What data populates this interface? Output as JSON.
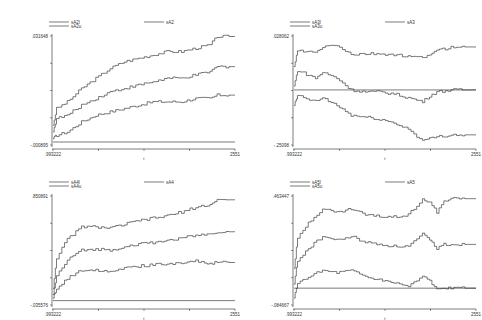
{
  "chart_data": [
    {
      "type": "line",
      "title": "",
      "xlabel": "t",
      "ylabel": "",
      "x_ticks": [
        ".993222",
        "2551"
      ],
      "y_ticks": [
        ".031648",
        "-.000895"
      ],
      "xlim": [
        0.993222,
        2551
      ],
      "ylim": [
        -0.000895,
        0.031648
      ],
      "legend": [
        "sA2l",
        "sA2u",
        "sA2"
      ],
      "legend_position": "top",
      "grid": false,
      "series": [
        {
          "name": "sA2u",
          "x": [
            1,
            50,
            200,
            400,
            600,
            800,
            1000,
            1200,
            1400,
            1600,
            1800,
            2000,
            2200,
            2300,
            2551
          ],
          "values": [
            0.005,
            0.01,
            0.012,
            0.016,
            0.019,
            0.022,
            0.024,
            0.025,
            0.026,
            0.027,
            0.027,
            0.028,
            0.029,
            0.0315,
            0.0315
          ]
        },
        {
          "name": "sA2",
          "x": [
            1,
            50,
            200,
            400,
            600,
            800,
            1000,
            1200,
            1400,
            1600,
            1800,
            2000,
            2200,
            2300,
            2551
          ],
          "values": [
            0.003,
            0.007,
            0.008,
            0.011,
            0.013,
            0.015,
            0.016,
            0.017,
            0.018,
            0.019,
            0.019,
            0.02,
            0.021,
            0.0225,
            0.0225
          ]
        },
        {
          "name": "sA2l",
          "x": [
            1,
            50,
            200,
            400,
            600,
            800,
            1000,
            1200,
            1400,
            1600,
            1800,
            2000,
            2200,
            2300,
            2551
          ],
          "values": [
            0.001,
            0.002,
            0.003,
            0.006,
            0.008,
            0.009,
            0.01,
            0.011,
            0.012,
            0.012,
            0.012,
            0.013,
            0.013,
            0.014,
            0.014
          ]
        },
        {
          "name": "zero",
          "x": [
            1,
            2551
          ],
          "values": [
            0.0,
            0.0
          ]
        }
      ]
    },
    {
      "type": "line",
      "title": "",
      "xlabel": "t",
      "ylabel": "",
      "x_ticks": [
        ".993222",
        "2551"
      ],
      "y_ticks": [
        ".028062",
        "-.25098"
      ],
      "xlim": [
        0.993222,
        2551
      ],
      "ylim": [
        -0.25098,
        0.028062
      ],
      "legend": [
        "sA3l",
        "sA3u",
        "sA3"
      ],
      "legend_position": "top",
      "grid": false,
      "series": [
        {
          "name": "sA3u",
          "x": [
            1,
            50,
            300,
            400,
            600,
            800,
            1000,
            1200,
            1400,
            1600,
            1800,
            1900,
            2000,
            2200,
            2551
          ],
          "values": [
            -0.05,
            -0.01,
            -0.015,
            0.0,
            0.005,
            -0.02,
            -0.018,
            -0.018,
            -0.02,
            -0.025,
            -0.028,
            -0.018,
            -0.01,
            0.0,
            0.0
          ]
        },
        {
          "name": "sA3",
          "x": [
            1,
            50,
            300,
            400,
            600,
            800,
            1000,
            1200,
            1400,
            1600,
            1800,
            1900,
            2000,
            2200,
            2551
          ],
          "values": [
            -0.1,
            -0.06,
            -0.08,
            -0.065,
            -0.08,
            -0.11,
            -0.115,
            -0.115,
            -0.12,
            -0.13,
            -0.14,
            -0.125,
            -0.115,
            -0.11,
            -0.11
          ]
        },
        {
          "name": "sA3l",
          "x": [
            1,
            50,
            300,
            400,
            600,
            800,
            1000,
            1200,
            1400,
            1600,
            1800,
            1900,
            2000,
            2200,
            2551
          ],
          "values": [
            -0.15,
            -0.125,
            -0.14,
            -0.13,
            -0.15,
            -0.175,
            -0.18,
            -0.185,
            -0.195,
            -0.21,
            -0.24,
            -0.235,
            -0.23,
            -0.225,
            -0.225
          ]
        },
        {
          "name": "zero",
          "x": [
            1,
            2551
          ],
          "values": [
            -0.11,
            -0.11
          ]
        }
      ]
    },
    {
      "type": "line",
      "title": "",
      "xlabel": "t",
      "ylabel": "",
      "x_ticks": [
        ".993222",
        "2551"
      ],
      "y_ticks": [
        ".850891",
        "-.035576"
      ],
      "xlim": [
        0.993222,
        2551
      ],
      "ylim": [
        -0.035576,
        0.850891
      ],
      "legend": [
        "sA4l",
        "sA4u",
        "sA4"
      ],
      "legend_position": "top",
      "grid": false,
      "series": [
        {
          "name": "sA4u",
          "x": [
            1,
            50,
            200,
            400,
            600,
            800,
            1000,
            1200,
            1400,
            1600,
            1800,
            2000,
            2200,
            2300,
            2551
          ],
          "values": [
            0.1,
            0.35,
            0.5,
            0.6,
            0.6,
            0.59,
            0.62,
            0.65,
            0.67,
            0.69,
            0.72,
            0.76,
            0.78,
            0.82,
            0.82
          ]
        },
        {
          "name": "sA4",
          "x": [
            1,
            50,
            200,
            400,
            600,
            800,
            1000,
            1200,
            1400,
            1600,
            1800,
            2000,
            2200,
            2300,
            2551
          ],
          "values": [
            0.05,
            0.2,
            0.33,
            0.41,
            0.42,
            0.41,
            0.44,
            0.46,
            0.47,
            0.49,
            0.51,
            0.53,
            0.54,
            0.56,
            0.56
          ]
        },
        {
          "name": "sA4l",
          "x": [
            1,
            50,
            200,
            400,
            600,
            800,
            1000,
            1200,
            1400,
            1600,
            1800,
            2000,
            2200,
            2300,
            2551
          ],
          "values": [
            0.02,
            0.1,
            0.18,
            0.25,
            0.25,
            0.24,
            0.27,
            0.28,
            0.29,
            0.3,
            0.31,
            0.32,
            0.3,
            0.31,
            0.31
          ]
        },
        {
          "name": "zero",
          "x": [
            1,
            2551
          ],
          "values": [
            0.0,
            0.0
          ]
        }
      ]
    },
    {
      "type": "line",
      "title": "",
      "xlabel": "t",
      "ylabel": "",
      "x_ticks": [
        ".993222",
        "2551"
      ],
      "y_ticks": [
        ".463447",
        "-.084667"
      ],
      "xlim": [
        0.993222,
        2551
      ],
      "ylim": [
        -0.084667,
        0.463447
      ],
      "legend": [
        "sA5l",
        "sA5u",
        "sA5"
      ],
      "legend_position": "top",
      "grid": false,
      "series": [
        {
          "name": "sA5u",
          "x": [
            1,
            50,
            200,
            400,
            600,
            800,
            1000,
            1200,
            1400,
            1600,
            1800,
            1900,
            2000,
            2100,
            2200,
            2551
          ],
          "values": [
            0.1,
            0.25,
            0.33,
            0.4,
            0.38,
            0.4,
            0.37,
            0.36,
            0.36,
            0.37,
            0.45,
            0.43,
            0.38,
            0.44,
            0.45,
            0.45
          ]
        },
        {
          "name": "sA5",
          "x": [
            1,
            50,
            200,
            400,
            600,
            800,
            1000,
            1200,
            1400,
            1600,
            1800,
            1900,
            2000,
            2100,
            2200,
            2551
          ],
          "values": [
            0.02,
            0.14,
            0.2,
            0.26,
            0.24,
            0.26,
            0.23,
            0.22,
            0.21,
            0.21,
            0.27,
            0.24,
            0.2,
            0.22,
            0.22,
            0.22
          ]
        },
        {
          "name": "sA5l",
          "x": [
            1,
            50,
            200,
            400,
            600,
            800,
            1000,
            1200,
            1400,
            1600,
            1800,
            1900,
            2000,
            2100,
            2200,
            2551
          ],
          "values": [
            -0.05,
            0.02,
            0.06,
            0.09,
            0.08,
            0.09,
            0.06,
            0.04,
            0.03,
            0.01,
            0.06,
            0.04,
            -0.01,
            0.0,
            0.0,
            0.0
          ]
        },
        {
          "name": "zero",
          "x": [
            1,
            2551
          ],
          "values": [
            0.0,
            0.0
          ]
        }
      ]
    }
  ]
}
